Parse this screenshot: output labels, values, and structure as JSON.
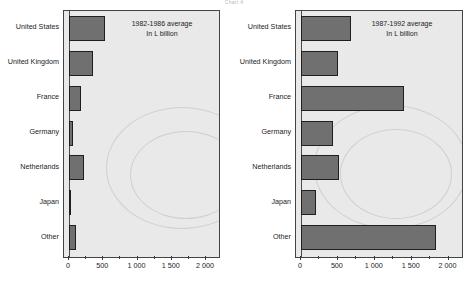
{
  "figure": {
    "title": "Chart 4"
  },
  "chart_data": [
    {
      "type": "bar",
      "orientation": "horizontal",
      "title": "1982-1986 average",
      "subtitle": "In L billion",
      "panel": "left",
      "xlabel": "",
      "ylabel": "",
      "xlim": [
        0,
        2200
      ],
      "grid": false,
      "legend": "none",
      "categories": [
        "United States",
        "United Kingdom",
        "France",
        "Germany",
        "Netherlands",
        "Japan",
        "Other"
      ],
      "values": [
        530,
        350,
        170,
        60,
        225,
        20,
        95
      ],
      "tick_values": [
        0,
        500,
        1000,
        1500,
        2000
      ],
      "tick_labels": [
        "0",
        "500",
        "1 000",
        "1 500",
        "2 000"
      ],
      "bar_color": "#707070",
      "plot_background": "#e9e9e9"
    },
    {
      "type": "bar",
      "orientation": "horizontal",
      "title": "1987-1992 average",
      "subtitle": "In L billion",
      "panel": "right",
      "xlabel": "",
      "ylabel": "",
      "xlim": [
        0,
        2200
      ],
      "grid": false,
      "legend": "none",
      "categories": [
        "United States",
        "United Kingdom",
        "France",
        "Germany",
        "Netherlands",
        "Japan",
        "Other"
      ],
      "values": [
        680,
        500,
        1390,
        430,
        510,
        210,
        1830
      ],
      "tick_values": [
        0,
        500,
        1000,
        1500,
        2000
      ],
      "tick_labels": [
        "0",
        "500",
        "1 000",
        "1 500",
        "2 000"
      ],
      "bar_color": "#707070",
      "plot_background": "#e9e9e9"
    }
  ]
}
